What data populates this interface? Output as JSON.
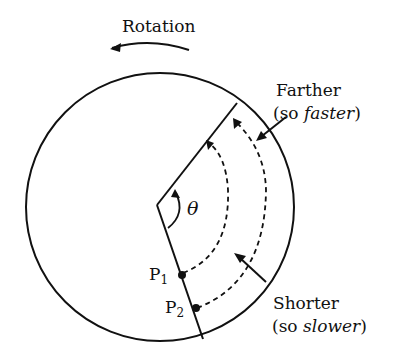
{
  "title": "Rotation",
  "labels": {
    "farther": "Farther",
    "farther_note_prefix": "(so ",
    "farther_note_em": "faster",
    "farther_note_suffix": ")",
    "shorter": "Shorter",
    "shorter_note_prefix": "(so ",
    "shorter_note_em": "slower",
    "shorter_note_suffix": ")",
    "theta": "θ",
    "p1": "P",
    "p1_sub": "1",
    "p2": "P",
    "p2_sub": "2"
  }
}
